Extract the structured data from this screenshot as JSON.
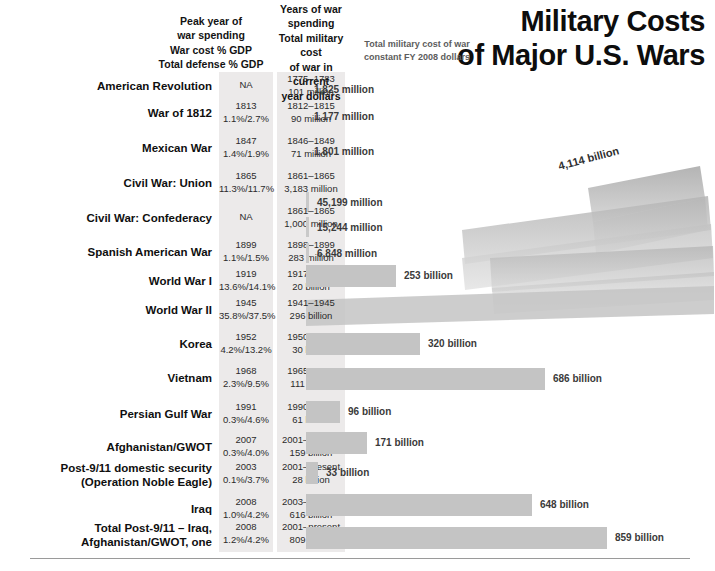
{
  "title": {
    "line1": "Military Costs",
    "line2": "of Major U.S. Wars"
  },
  "headers": {
    "peak_col": "Peak year of\nwar spending\nWar cost % GDP\nTotal defense % GDP",
    "years_col": "Years of war\nspending\nTotal military cost\nof war in current\nyear dollars",
    "constant_col": "Total military cost of war\nconstant FY 2008 dollars"
  },
  "chart_data": {
    "type": "bar",
    "title": "Military Costs of Major U.S. Wars",
    "xlabel": "Total military cost of war, constant FY 2008 dollars",
    "ylabel": "War",
    "grid": false,
    "legend": "none",
    "categories": [
      "American Revolution",
      "War of 1812",
      "Mexican War",
      "Civil War: Union",
      "Civil War: Confederacy",
      "Spanish American War",
      "World War I",
      "World War II",
      "Korea",
      "Vietnam",
      "Persian Gulf War",
      "Afghanistan/GWOT",
      "Post-9/11 domestic security (Operation Noble Eagle)",
      "Iraq",
      "Total Post-9/11 – Iraq, Afghanistan/GWOT, one"
    ],
    "values": [
      1.825,
      1.177,
      1.801,
      45.199,
      15.244,
      6.848,
      253,
      4114,
      320,
      686,
      96,
      171,
      33,
      648,
      859
    ],
    "value_labels": [
      "1,825 million",
      "1,177 million",
      "1,801 million",
      "45,199 million",
      "15,244 million",
      "6,848 million",
      "253 billion",
      "4,114 billion",
      "320 billion",
      "686 billion",
      "96 billion",
      "171 billion",
      "33 billion",
      "648 billion",
      "859 billion"
    ],
    "units": "billions of constant FY 2008 dollars"
  },
  "rows": [
    {
      "war": "American Revolution",
      "peak": "NA",
      "years": "1775–1783",
      "current": "101 million",
      "constant_label": "1,825 million",
      "bar_px": 0
    },
    {
      "war": "War of 1812",
      "peak": "1813",
      "gdp": "1.1%/2.7%",
      "years": "1812–1815",
      "current": "90 million",
      "constant_label": "1,177 million",
      "bar_px": 0
    },
    {
      "war": "Mexican War",
      "peak": "1847",
      "gdp": "1.4%/1.9%",
      "years": "1846–1849",
      "current": "71 million",
      "constant_label": "1,801 million",
      "bar_px": 0
    },
    {
      "war": "Civil War: Union",
      "peak": "1865",
      "gdp": "11.3%/11.7%",
      "years": "1861–1865",
      "current": "3,183 million",
      "constant_label": "45,199 million",
      "bar_px": 3
    },
    {
      "war": "Civil War: Confederacy",
      "peak": "NA",
      "years": "1861–1865",
      "current": "1,000 million",
      "constant_label": "15,244 million",
      "bar_px": 3
    },
    {
      "war": "Spanish American War",
      "peak": "1899",
      "gdp": "1.1%/1.5%",
      "years": "1898–1899",
      "current": "283 million",
      "constant_label": "6,848 million",
      "bar_px": 3
    },
    {
      "war": "World War I",
      "peak": "1919",
      "gdp": "13.6%/14.1%",
      "years": "1917–1921",
      "current": "20 billion",
      "constant_label": "253 billion",
      "bar_px": 90
    },
    {
      "war": "World War II",
      "peak": "1945",
      "gdp": "35.8%/37.5%",
      "years": "1941–1945",
      "current": "296 billion",
      "constant_label": "4,114 billion",
      "bar_px": 401
    },
    {
      "war": "Korea",
      "peak": "1952",
      "gdp": "4.2%/13.2%",
      "years": "1950–1953",
      "current": "30 billion",
      "constant_label": "320 billion",
      "bar_px": 114
    },
    {
      "war": "Vietnam",
      "peak": "1968",
      "gdp": "2.3%/9.5%",
      "years": "1965–1975",
      "current": "111 billion",
      "constant_label": "686 billion",
      "bar_px": 239
    },
    {
      "war": "Persian Gulf War",
      "peak": "1991",
      "gdp": "0.3%/4.6%",
      "years": "1990–1991",
      "current": "61 billion",
      "constant_label": "96 billion",
      "bar_px": 34
    },
    {
      "war": "Afghanistan/GWOT",
      "peak": "2007",
      "gdp": "0.3%/4.0%",
      "years": "2001–present",
      "current": "159 billion",
      "constant_label": "171 billion",
      "bar_px": 61
    },
    {
      "war": "Post-9/11 domestic security",
      "war2": "(Operation Noble Eagle)",
      "peak": "2003",
      "gdp": "0.1%/3.7%",
      "years": "2001–present",
      "current": "28 billion",
      "constant_label": "33 billion",
      "bar_px": 12
    },
    {
      "war": "Iraq",
      "peak": "2008",
      "gdp": "1.0%/4.2%",
      "years": "2003–present",
      "current": "616 billion",
      "constant_label": "648 billion",
      "bar_px": 226
    },
    {
      "war": "Total Post-9/11 – Iraq,",
      "war2": "Afghanistan/GWOT, one",
      "peak": "2008",
      "gdp": "1.2%/4.2%",
      "years": "2001–present",
      "current": "809 billion",
      "constant_label": "859 billion",
      "bar_px": 301
    }
  ],
  "colors": {
    "bar": "#c4c4c4",
    "band": "#eceaea",
    "text": "#0f0f0f",
    "muted": "#5c5c5c"
  }
}
